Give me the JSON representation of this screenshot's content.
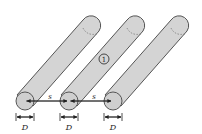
{
  "diagram": {
    "title": "",
    "cylinders": [
      {
        "id": "cylinder-1",
        "label": ""
      },
      {
        "id": "cylinder-2",
        "label": "①"
      },
      {
        "id": "cylinder-3",
        "label": ""
      }
    ],
    "dimensions": {
      "spacing_label": "s",
      "diameter_label": "D"
    },
    "colors": {
      "cylinder_fill": "#d4d4d4",
      "outline": "#555555",
      "line": "#222222"
    }
  }
}
